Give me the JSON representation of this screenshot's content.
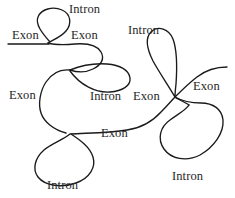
{
  "diagram": {
    "stroke_color": "#1a1a1a",
    "background_color": "#ffffff",
    "text_color": "#262626",
    "labels": [
      {
        "text": "Intron",
        "name": "label-intron-top-left",
        "x": 69,
        "y": 3
      },
      {
        "text": "Exon",
        "name": "label-exon-left-top",
        "x": 12,
        "y": 29
      },
      {
        "text": "Exon",
        "name": "label-exon-top-middle",
        "x": 71,
        "y": 29
      },
      {
        "text": "Intron",
        "name": "label-intron-top-right",
        "x": 128,
        "y": 24
      },
      {
        "text": "Exon",
        "name": "label-exon-left-middle",
        "x": 9,
        "y": 89
      },
      {
        "text": "Intron",
        "name": "label-intron-center",
        "x": 90,
        "y": 90
      },
      {
        "text": "Exon",
        "name": "label-exon-junction",
        "x": 133,
        "y": 90
      },
      {
        "text": "Exon",
        "name": "label-exon-right",
        "x": 193,
        "y": 80
      },
      {
        "text": "Exon",
        "name": "label-exon-bottom-middle",
        "x": 101,
        "y": 127
      },
      {
        "text": "Intron",
        "name": "label-intron-bottom-left",
        "x": 47,
        "y": 179
      },
      {
        "text": "Intron",
        "name": "label-intron-bottom-right",
        "x": 172,
        "y": 170
      }
    ],
    "paths": [
      {
        "name": "strand-exon-left-top",
        "d": "M 8 44 L 49 44"
      },
      {
        "name": "strand-intron-loop-top-left",
        "d": "M 50 42 C 42 33, 35 24, 38 17 C 41 9, 53 6, 62 10 C 71 14, 72 24, 66 31 C 60 38, 52 40, 48 43"
      },
      {
        "name": "strand-exon-top-middle",
        "d": "M 48 43 C 55 45, 64 45, 75 44 C 88 43, 97 45, 101 52 C 105 59, 101 65, 93 69 C 85 73, 76 72, 70 70"
      },
      {
        "name": "strand-intron-loop-center",
        "d": "M 70 70 C 80 66, 95 63, 107 64 C 120 65, 129 70, 130 78 C 131 86, 122 91, 110 92 C 96 93, 80 85, 70 71"
      },
      {
        "name": "strand-exon-left-middle",
        "d": "M 70 70 C 60 69, 52 73, 46 82 C 40 91, 38 104, 41 113 C 44 122, 54 130, 66 133"
      },
      {
        "name": "strand-intron-loop-bottom-left",
        "d": "M 70 134 C 63 140, 52 143, 44 150 C 35 158, 32 169, 38 177 C 45 186, 62 188, 76 183 C 90 178, 96 167, 93 157 C 90 147, 80 140, 71 134"
      },
      {
        "name": "strand-exon-bottom-middle",
        "d": "M 71 134 C 86 133, 108 133, 127 130 C 141 128, 152 122, 161 112 C 168 105, 172 100, 175 97"
      },
      {
        "name": "strand-intron-loop-top-right",
        "d": "M 175 97 C 168 85, 159 72, 153 61 C 147 49, 145 38, 151 32 C 158 25, 169 29, 173 39 C 177 50, 177 70, 176 84 C 175 92, 175 95, 175 97"
      },
      {
        "name": "strand-exon-right",
        "d": "M 175 97 C 181 91, 189 83, 197 77 C 206 70, 216 67, 227 67"
      },
      {
        "name": "strand-intron-loop-bottom-right",
        "d": "M 175 97 C 182 101, 192 103, 201 103 C 213 103, 222 109, 223 120 C 224 133, 214 147, 200 155 C 186 162, 171 159, 164 149 C 157 139, 160 127, 170 120 C 178 114, 186 110, 189 105"
      },
      {
        "name": "strand-exon-bottom-right-tail",
        "d": "M 189 105 C 186 103, 182 101, 176 98"
      }
    ]
  }
}
